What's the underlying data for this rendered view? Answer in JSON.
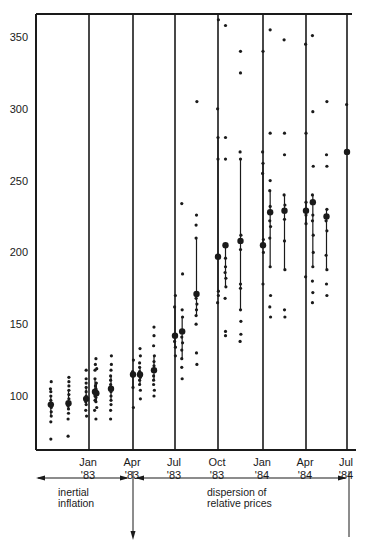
{
  "chart_data": {
    "type": "scatter",
    "title": "",
    "xlabel": "",
    "ylabel": "",
    "ylim": [
      60,
      365
    ],
    "grid": "vertical lines at each quarter",
    "y_ticks": [
      100,
      150,
      200,
      250,
      300,
      350
    ],
    "x_ticks": [
      {
        "month": "Jan",
        "year": "'83"
      },
      {
        "month": "Apr",
        "year": "'83"
      },
      {
        "month": "Jul",
        "year": "'83"
      },
      {
        "month": "Oct",
        "year": "'83"
      },
      {
        "month": "Jan",
        "year": "'84"
      },
      {
        "month": "Apr",
        "year": "'84"
      },
      {
        "month": "Jul",
        "year": "'84"
      }
    ],
    "annotations": [
      {
        "text_lines": [
          "inertial",
          "inflation"
        ],
        "span": [
          "start",
          "Apr '83"
        ]
      },
      {
        "text_lines": [
          "dispersion of",
          "relative prices"
        ],
        "span": [
          "Apr '83",
          "Jul '84"
        ]
      }
    ],
    "series": [
      {
        "x": 0.5,
        "mean": 94,
        "points": [
          70,
          82,
          86,
          89,
          92,
          94,
          97,
          100,
          103,
          105,
          110
        ]
      },
      {
        "x": 1.5,
        "mean": 95,
        "points": [
          72,
          84,
          88,
          91,
          93,
          95,
          98,
          101,
          104,
          107,
          110,
          113
        ]
      },
      {
        "x": 2.5,
        "mean": 98,
        "points": [
          86,
          90,
          94,
          96,
          98,
          100,
          103,
          106,
          109,
          112,
          118
        ]
      },
      {
        "x": 3.0,
        "mean": 103,
        "points": [
          90,
          97,
          100,
          103,
          107,
          112,
          118,
          122
        ]
      },
      {
        "x": 3.5,
        "mean": 102,
        "points": [
          84,
          92,
          96,
          99,
          102,
          105,
          109,
          119,
          126
        ]
      },
      {
        "x": 4.5,
        "mean": 105,
        "points": [
          84,
          90,
          94,
          97,
          100,
          103,
          105,
          108,
          111,
          114,
          118,
          122,
          128
        ]
      },
      {
        "x": 6.0,
        "mean": 115,
        "points": [
          92,
          106,
          114,
          117,
          125
        ]
      },
      {
        "x": 6.5,
        "mean": 115,
        "points": [
          98,
          104,
          108,
          111,
          113,
          115,
          117,
          120,
          123,
          128,
          133
        ]
      },
      {
        "x": 7.5,
        "mean": 118,
        "points": [
          100,
          104,
          108,
          111,
          114,
          118,
          121,
          124,
          128,
          135,
          142,
          148
        ]
      },
      {
        "x": 9.0,
        "mean": 142,
        "points": [
          128,
          134,
          138,
          142,
          162,
          170
        ]
      },
      {
        "x": 9.5,
        "mean": 145,
        "points": [
          112,
          120,
          126,
          132,
          137,
          141,
          145,
          155,
          160,
          185,
          234
        ]
      },
      {
        "x": 10.5,
        "mean": 171,
        "points": [
          122,
          130,
          150,
          156,
          160,
          164,
          168,
          171,
          210,
          219,
          226,
          305
        ]
      },
      {
        "x": 12.0,
        "mean": 197,
        "points": [
          165,
          170,
          173,
          197,
          265,
          280,
          300,
          362
        ]
      },
      {
        "x": 12.5,
        "mean": 205,
        "points": [
          142,
          145,
          168,
          176,
          182,
          186,
          190,
          196,
          205,
          265,
          280,
          358
        ]
      },
      {
        "x": 13.5,
        "mean": 208,
        "points": [
          138,
          143,
          152,
          160,
          175,
          178,
          202,
          208,
          212,
          265,
          270,
          325,
          340
        ]
      },
      {
        "x": 15.0,
        "mean": 205,
        "points": [
          178,
          200,
          205,
          209,
          255,
          262,
          270,
          340
        ]
      },
      {
        "x": 15.5,
        "mean": 228,
        "points": [
          155,
          162,
          170,
          190,
          210,
          218,
          222,
          228,
          232,
          243,
          250,
          283,
          355
        ]
      },
      {
        "x": 16.5,
        "mean": 229,
        "points": [
          155,
          160,
          188,
          208,
          223,
          229,
          233,
          240,
          268,
          283,
          348
        ]
      },
      {
        "x": 18.0,
        "mean": 229,
        "points": [
          183,
          220,
          226,
          229,
          235,
          283,
          345
        ]
      },
      {
        "x": 18.5,
        "mean": 235,
        "points": [
          165,
          172,
          180,
          190,
          200,
          212,
          222,
          226,
          235,
          240,
          260,
          298,
          351
        ]
      },
      {
        "x": 19.5,
        "mean": 225,
        "points": [
          170,
          178,
          188,
          198,
          215,
          222,
          225,
          230,
          260,
          268,
          305
        ]
      },
      {
        "x": 21.0,
        "mean": 270,
        "points": [
          270,
          303
        ]
      }
    ]
  },
  "axis": {
    "y_labels": [
      "350",
      "300",
      "250",
      "200",
      "150",
      "100"
    ]
  },
  "annotations": {
    "left_line1": "inertial",
    "left_line2": "inflation",
    "right_line1": "dispersion of",
    "right_line2": "relative prices"
  }
}
